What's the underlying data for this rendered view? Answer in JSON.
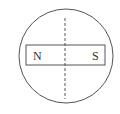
{
  "diagram": {
    "magnet": {
      "left_pole": "N",
      "right_pole": "S"
    },
    "colors": {
      "stroke": "#555555",
      "background": "#ffffff"
    }
  }
}
